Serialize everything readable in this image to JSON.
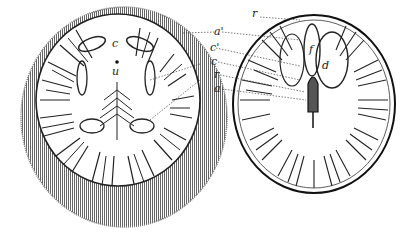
{
  "figure": {
    "left_section": {
      "labels": [
        {
          "id": "c",
          "text": "c",
          "x": 112,
          "y": 42
        },
        {
          "id": "u",
          "text": "u",
          "x": 112,
          "y": 67
        }
      ]
    },
    "right_section": {
      "labels": [
        {
          "id": "r_top",
          "text": "r",
          "x": 253,
          "y": 13
        },
        {
          "id": "a_prime",
          "text": "a'",
          "x": 214,
          "y": 29
        },
        {
          "id": "c_prime",
          "text": "c'",
          "x": 210,
          "y": 46
        },
        {
          "id": "c",
          "text": "c",
          "x": 212,
          "y": 60
        },
        {
          "id": "r",
          "text": "r",
          "x": 215,
          "y": 73
        },
        {
          "id": "a",
          "text": "a",
          "x": 215,
          "y": 87
        },
        {
          "id": "f",
          "text": "f",
          "x": 310,
          "y": 46
        },
        {
          "id": "d",
          "text": "d",
          "x": 322,
          "y": 63
        }
      ]
    },
    "colors": {
      "ink": "#1a1a1a",
      "paper": "#ffffff",
      "fringe": "#6a6a6a"
    }
  }
}
